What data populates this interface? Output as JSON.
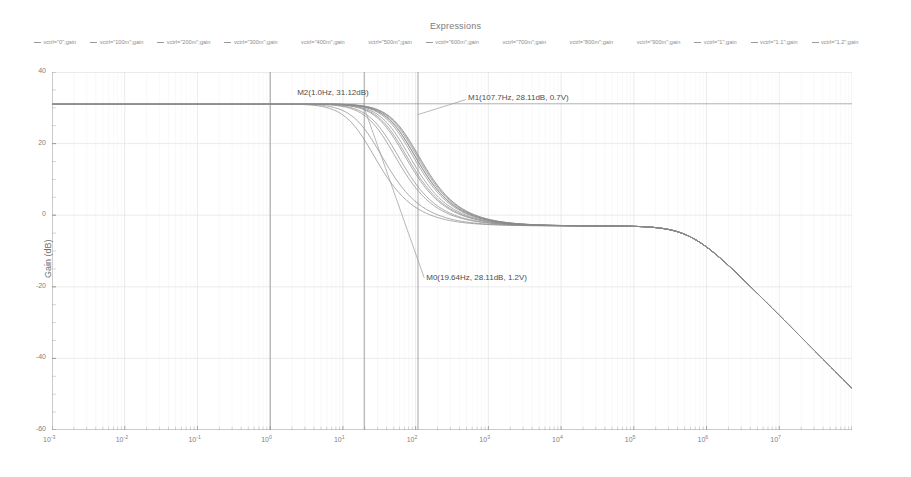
{
  "chart_title": "Expressions",
  "legend": {
    "items": [
      {
        "label": "vctrl=\"0\";gain",
        "color": "#9a9a9a"
      },
      {
        "label": "vctrl=\"100m\";gain",
        "color": "#9a9a9a"
      },
      {
        "label": "vctrl=\"200m\";gain",
        "color": "#9a9a9a"
      },
      {
        "label": "vctrl=\"300m\";gain",
        "color": "#9a9a9a"
      },
      {
        "label": "vctrl=\"400m\";gain",
        "color": "#ffffff"
      },
      {
        "label": "vctrl=\"500m\";gain",
        "color": "#ffffff"
      },
      {
        "label": "vctrl=\"600m\";gain",
        "color": "#9a9a9a"
      },
      {
        "label": "vctrl=\"700m\";gain",
        "color": "#ffffff"
      },
      {
        "label": "vctrl=\"800m\";gain",
        "color": "#ffffff"
      },
      {
        "label": "vctrl=\"900m\";gain",
        "color": "#ffffff"
      },
      {
        "label": "vctrl=\"1\";gain",
        "color": "#9a9a9a"
      },
      {
        "label": "vctrl=\"1.1\";gain",
        "color": "#9a9a9a"
      },
      {
        "label": "vctrl=\"1.2\";gain",
        "color": "#9a9a9a"
      }
    ]
  },
  "axes": {
    "xlabel": "freq (Hz)",
    "ylabel": "Gain (dB)",
    "xticks": [
      {
        "mant": "10",
        "exp": "-3"
      },
      {
        "mant": "10",
        "exp": "-2"
      },
      {
        "mant": "10",
        "exp": "-1"
      },
      {
        "mant": "10",
        "exp": "0"
      },
      {
        "mant": "10",
        "exp": "1"
      },
      {
        "mant": "10",
        "exp": "2"
      },
      {
        "mant": "10",
        "exp": "3"
      },
      {
        "mant": "10",
        "exp": "4"
      },
      {
        "mant": "10",
        "exp": "5"
      },
      {
        "mant": "10",
        "exp": "6"
      },
      {
        "mant": "10",
        "exp": "7"
      }
    ],
    "yticks": [
      "40",
      "20",
      "0",
      "-20",
      "-40",
      "-60"
    ]
  },
  "markers": [
    {
      "name": "M2",
      "text": "M2(1.0Hz, 31.12dB)"
    },
    {
      "name": "M1",
      "text": "M1(107.7Hz, 28.11dB, 0.7V)"
    },
    {
      "name": "M0",
      "text": "M0(19.64Hz, 28.11dB, 1.2V)"
    }
  ],
  "chart_data": {
    "type": "line",
    "title": "Expressions",
    "xlabel": "freq (Hz)",
    "ylabel": "Gain (dB)",
    "xscale": "log",
    "xlim": [
      0.001,
      100000000
    ],
    "ylim": [
      -60,
      40
    ],
    "grid": true,
    "legend_position": "top",
    "annotations": [
      {
        "label": "M2(1.0Hz, 31.12dB)",
        "freq_hz": 1.0,
        "gain_db": 31.12
      },
      {
        "label": "M1(107.7Hz, 28.11dB, 0.7V)",
        "freq_hz": 107.7,
        "gain_db": 28.11,
        "vctrl_v": 0.7
      },
      {
        "label": "M0(19.64Hz, 28.11dB, 1.2V)",
        "freq_hz": 19.64,
        "gain_db": 28.11,
        "vctrl_v": 1.2
      }
    ],
    "cursor_lines": [
      {
        "type": "horizontal",
        "gain_db": 31.12
      },
      {
        "type": "vertical",
        "freq_hz": 1.0
      },
      {
        "type": "vertical",
        "freq_hz": 19.64
      },
      {
        "type": "vertical",
        "freq_hz": 107.7
      }
    ],
    "x": [
      0.001,
      0.01,
      0.1,
      1,
      10,
      100,
      1000,
      10000,
      100000,
      1000000,
      10000000,
      100000000
    ],
    "series": [
      {
        "name": "vctrl=\"0\";gain",
        "vctrl_v": 0.0,
        "values": [
          31.1,
          31.1,
          31.1,
          31.1,
          30.6,
          25.5,
          4.0,
          -3.0,
          -3.0,
          -5.0,
          -22.0,
          -57.0
        ]
      },
      {
        "name": "vctrl=\"100m\";gain",
        "vctrl_v": 0.1,
        "values": [
          31.1,
          31.1,
          31.1,
          31.1,
          30.7,
          26.4,
          5.2,
          -3.0,
          -3.0,
          -5.0,
          -22.0,
          -57.0
        ]
      },
      {
        "name": "vctrl=\"200m\";gain",
        "vctrl_v": 0.2,
        "values": [
          31.1,
          31.1,
          31.1,
          31.1,
          30.8,
          27.0,
          6.2,
          -3.0,
          -3.0,
          -5.0,
          -22.0,
          -57.0
        ]
      },
      {
        "name": "vctrl=\"300m\";gain",
        "vctrl_v": 0.3,
        "values": [
          31.1,
          31.1,
          31.1,
          31.1,
          30.8,
          27.5,
          7.0,
          -2.9,
          -3.0,
          -5.0,
          -22.0,
          -57.0
        ]
      },
      {
        "name": "vctrl=\"400m\";gain",
        "vctrl_v": 0.4,
        "values": [
          31.1,
          31.1,
          31.1,
          31.1,
          30.9,
          27.8,
          7.6,
          -2.9,
          -3.0,
          -5.0,
          -22.0,
          -57.0
        ]
      },
      {
        "name": "vctrl=\"500m\";gain",
        "vctrl_v": 0.5,
        "values": [
          31.1,
          31.1,
          31.1,
          31.1,
          30.9,
          28.0,
          8.0,
          -2.8,
          -3.0,
          -5.0,
          -22.0,
          -57.0
        ]
      },
      {
        "name": "vctrl=\"600m\";gain",
        "vctrl_v": 0.6,
        "values": [
          31.1,
          31.1,
          31.1,
          31.1,
          30.9,
          28.1,
          8.3,
          -2.8,
          -3.0,
          -5.0,
          -22.0,
          -57.0
        ]
      },
      {
        "name": "vctrl=\"700m\";gain",
        "vctrl_v": 0.7,
        "values": [
          31.1,
          31.1,
          31.1,
          31.1,
          30.9,
          28.11,
          8.4,
          -2.8,
          -3.0,
          -5.0,
          -22.0,
          -57.0
        ]
      },
      {
        "name": "vctrl=\"800m\";gain",
        "vctrl_v": 0.8,
        "values": [
          31.1,
          31.1,
          31.1,
          31.1,
          30.8,
          27.6,
          7.4,
          -2.9,
          -3.0,
          -5.0,
          -22.0,
          -57.0
        ]
      },
      {
        "name": "vctrl=\"900m\";gain",
        "vctrl_v": 0.9,
        "values": [
          31.1,
          31.1,
          31.1,
          31.1,
          30.6,
          25.8,
          4.6,
          -3.0,
          -3.0,
          -5.0,
          -22.0,
          -57.0
        ]
      },
      {
        "name": "vctrl=\"1\";gain",
        "vctrl_v": 1.0,
        "values": [
          31.1,
          31.1,
          31.1,
          31.1,
          30.2,
          22.5,
          0.5,
          -3.0,
          -3.0,
          -5.0,
          -22.0,
          -57.0
        ]
      },
      {
        "name": "vctrl=\"1.1\";gain",
        "vctrl_v": 1.1,
        "values": [
          31.1,
          31.1,
          31.1,
          31.0,
          29.4,
          18.0,
          -2.0,
          -3.0,
          -3.0,
          -5.0,
          -22.0,
          -57.0
        ]
      },
      {
        "name": "vctrl=\"1.2\";gain",
        "vctrl_v": 1.2,
        "values": [
          31.1,
          31.1,
          31.1,
          31.0,
          28.6,
          14.5,
          -2.8,
          -3.0,
          -3.0,
          -5.0,
          -22.0,
          -57.0
        ]
      }
    ]
  }
}
